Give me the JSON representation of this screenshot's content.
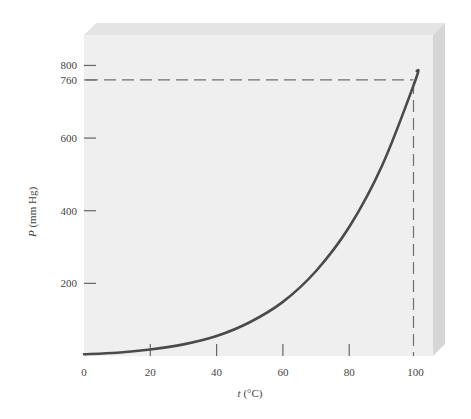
{
  "chart_data": {
    "type": "line",
    "title": "",
    "xlabel": "t (°C)",
    "ylabel": "P (mm Hg)",
    "xlabel_var": "t",
    "xlabel_unit": "(°C)",
    "ylabel_var": "P",
    "ylabel_unit": "(mm Hg)",
    "xlim": [
      0,
      100
    ],
    "ylim": [
      0,
      800
    ],
    "x_ticks": [
      0,
      20,
      40,
      60,
      80,
      100
    ],
    "y_ticks": [
      200,
      400,
      600,
      760,
      800
    ],
    "grid": false,
    "legend": null,
    "series": [
      {
        "name": "Vapor pressure",
        "x": [
          0,
          10,
          20,
          30,
          40,
          50,
          60,
          70,
          80,
          90,
          100
        ],
        "y": [
          5,
          9,
          18,
          32,
          55,
          93,
          149,
          234,
          355,
          526,
          760
        ]
      }
    ],
    "annotations": [
      {
        "type": "dashed-hline",
        "y": 760,
        "x_range": [
          0,
          100
        ]
      },
      {
        "type": "dashed-vline",
        "x": 100,
        "y_range": [
          0,
          760
        ]
      }
    ]
  },
  "colors": {
    "panel": "#efefef",
    "panel_top": "#e2e2e2",
    "panel_side": "#d4d4d4",
    "curve": "#4a4a4a",
    "dash": "#707070",
    "tick": "#666666"
  }
}
